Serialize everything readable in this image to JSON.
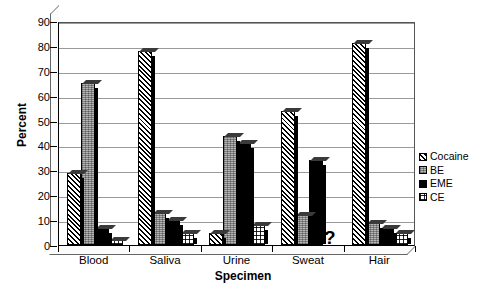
{
  "chart_data": {
    "type": "bar",
    "title": "",
    "subtitle": "",
    "xlabel": "Specimen",
    "ylabel": "Percent",
    "categories": [
      "Blood",
      "Saliva",
      "Urine",
      "Sweat",
      "Hair"
    ],
    "series": [
      {
        "name": "Cocaine",
        "pattern": "diagonal-hatch",
        "values": [
          29,
          78,
          5,
          54,
          81
        ]
      },
      {
        "name": "BE",
        "pattern": "gray-stipple",
        "values": [
          65,
          13,
          44,
          12,
          9
        ]
      },
      {
        "name": "EME",
        "pattern": "solid-black",
        "values": [
          7,
          10,
          41,
          34,
          7
        ]
      },
      {
        "name": "CE",
        "pattern": "light-dotted",
        "values": [
          2,
          5,
          8,
          null,
          5
        ]
      }
    ],
    "ylim": [
      0,
      90
    ],
    "ytick_step": 10,
    "yticks": [
      "90",
      "80",
      "70",
      "60",
      "50",
      "40",
      "30",
      "20",
      "10",
      "0"
    ],
    "grid": true,
    "grid_axis": "y",
    "legend_position": "right",
    "annotations": [
      {
        "text": "?",
        "series": "CE",
        "category": "Sweat",
        "meaning": "value-unknown"
      }
    ],
    "style": "3d-column",
    "colors": {
      "background": "#ffffff",
      "axis": "#000000",
      "gridline": "#9a9a9a",
      "cocaine": "#ffffff",
      "be": "#b5b5b5",
      "eme": "#000000",
      "ce": "#ffffff"
    }
  }
}
